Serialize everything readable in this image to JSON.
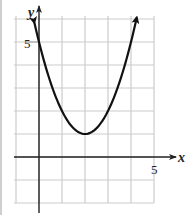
{
  "chart_data": {
    "type": "line",
    "title": "",
    "xlabel": "x",
    "ylabel": "y",
    "xlim": [
      -1,
      5
    ],
    "ylim": [
      -2,
      6
    ],
    "grid": true,
    "grid_step": 1,
    "tick_labels": {
      "x": [
        "5"
      ],
      "y": [
        "5"
      ]
    },
    "series": [
      {
        "name": "y = (x - 2)^2 + 1",
        "equation": "y = (x-2)^2 + 1",
        "vertex": [
          2,
          1
        ],
        "x": [
          -0.2,
          0,
          0.5,
          1,
          1.5,
          2,
          2.5,
          3,
          3.5,
          4,
          4.25
        ],
        "y": [
          5.84,
          5,
          3.25,
          2,
          1.25,
          1,
          1.25,
          2,
          3.25,
          5,
          6.06
        ],
        "arrows_at_ends": true
      }
    ],
    "colors": {
      "curve": "#111111",
      "grid": "#cccccc",
      "axis": "#222222"
    }
  },
  "axes": {
    "x_label": "x",
    "y_label": "y",
    "x_tick": "5",
    "y_tick": "5"
  }
}
